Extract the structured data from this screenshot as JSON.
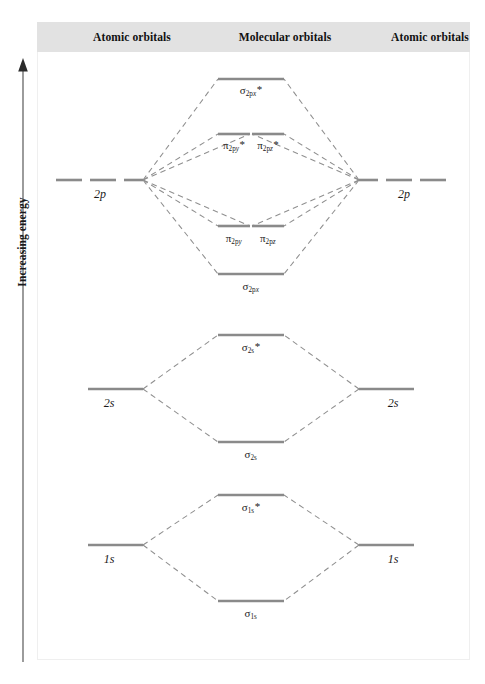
{
  "figure": {
    "energy_axis_label": "Increasing energy",
    "arrow_direction": "up"
  },
  "headers": {
    "left": "Atomic orbitals",
    "center": "Molecular orbitals",
    "right": "Atomic orbitals"
  },
  "atomic_orbitals": {
    "left": [
      {
        "label": "2p",
        "n": "2",
        "orbital": "p",
        "degeneracy": 3
      },
      {
        "label": "2s",
        "n": "2",
        "orbital": "s",
        "degeneracy": 1
      },
      {
        "label": "1s",
        "n": "1",
        "orbital": "s",
        "degeneracy": 1
      }
    ],
    "right": [
      {
        "label": "2p",
        "n": "2",
        "orbital": "p",
        "degeneracy": 3
      },
      {
        "label": "2s",
        "n": "2",
        "orbital": "s",
        "degeneracy": 1
      },
      {
        "label": "1s",
        "n": "1",
        "orbital": "s",
        "degeneracy": 1
      }
    ]
  },
  "molecular_orbitals": [
    {
      "id": "sigma-2px-star",
      "symbol": "σ",
      "sub": "2p",
      "subsub": "x",
      "star": "*",
      "type": "antibonding",
      "group": "2p"
    },
    {
      "id": "pi-2py-star",
      "symbol": "π",
      "sub": "2p",
      "subsub": "y",
      "star": "*",
      "type": "antibonding",
      "group": "2p"
    },
    {
      "id": "pi-2pz-star",
      "symbol": "π",
      "sub": "2p",
      "subsub": "z",
      "star": "*",
      "type": "antibonding",
      "group": "2p"
    },
    {
      "id": "pi-2py",
      "symbol": "π",
      "sub": "2p",
      "subsub": "y",
      "star": "",
      "type": "bonding",
      "group": "2p"
    },
    {
      "id": "pi-2pz",
      "symbol": "π",
      "sub": "2p",
      "subsub": "z",
      "star": "",
      "type": "bonding",
      "group": "2p"
    },
    {
      "id": "sigma-2px",
      "symbol": "σ",
      "sub": "2p",
      "subsub": "x",
      "star": "",
      "type": "bonding",
      "group": "2p"
    },
    {
      "id": "sigma-2s-star",
      "symbol": "σ",
      "sub": "2s",
      "subsub": "",
      "star": "*",
      "type": "antibonding",
      "group": "2s"
    },
    {
      "id": "sigma-2s",
      "symbol": "σ",
      "sub": "2s",
      "subsub": "",
      "star": "",
      "type": "bonding",
      "group": "2s"
    },
    {
      "id": "sigma-1s-star",
      "symbol": "σ",
      "sub": "1s",
      "subsub": "",
      "star": "*",
      "type": "antibonding",
      "group": "1s"
    },
    {
      "id": "sigma-1s",
      "symbol": "σ",
      "sub": "1s",
      "subsub": "",
      "star": "",
      "type": "bonding",
      "group": "1s"
    }
  ],
  "colors": {
    "level_line": "#8a8a8a",
    "dashed_line": "#8f8f8f",
    "header_band": "#e2e2e2",
    "text": "#1a1a1a",
    "panel_background": "#ffffff",
    "axis": "#4a4a4a"
  }
}
